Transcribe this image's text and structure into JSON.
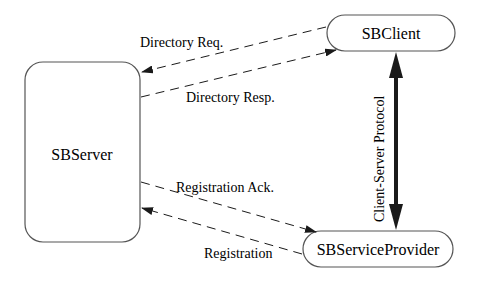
{
  "diagram": {
    "nodes": {
      "server": {
        "label": "SBServer"
      },
      "client": {
        "label": "SBClient"
      },
      "provider": {
        "label": "SBServiceProvider"
      }
    },
    "edges": {
      "directory_req": {
        "label": "Directory Req.",
        "from": "SBClient",
        "to": "SBServer",
        "style": "dashed"
      },
      "directory_resp": {
        "label": "Directory Resp.",
        "from": "SBServer",
        "to": "SBClient",
        "style": "dashed"
      },
      "registration_ack": {
        "label": "Registration Ack.",
        "from": "SBServer",
        "to": "SBServiceProvider",
        "style": "dashed"
      },
      "registration": {
        "label": "Registration",
        "from": "SBServiceProvider",
        "to": "SBServer",
        "style": "dashed"
      },
      "client_server_protocol": {
        "label": "Client-Server Protocol",
        "from": "SBClient",
        "to": "SBServiceProvider",
        "style": "bold-bidirectional"
      }
    },
    "colors": {
      "stroke": "#1a1a1a",
      "background": "#ffffff"
    }
  }
}
